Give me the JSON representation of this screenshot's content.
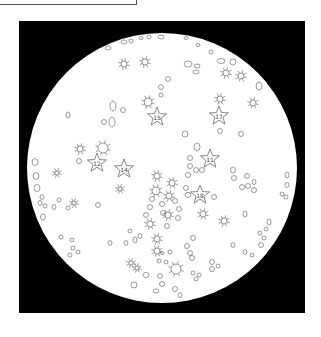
{
  "frame": {
    "label": ""
  },
  "plate": {
    "background": "#000000",
    "circle_fill": "#ffffff",
    "stroke": "#555555",
    "square": {
      "x": 19,
      "y": 21,
      "w": 286,
      "h": 292
    },
    "circle": {
      "cx": 162,
      "cy": 168,
      "r": 135
    }
  },
  "stars": [
    {
      "x": 157,
      "y": 117,
      "r": 10,
      "label": "15"
    },
    {
      "x": 219,
      "y": 116,
      "r": 10,
      "label": "17"
    },
    {
      "x": 97,
      "y": 163,
      "r": 10,
      "label": "12"
    },
    {
      "x": 124,
      "y": 169,
      "r": 10,
      "label": "14"
    },
    {
      "x": 210,
      "y": 159,
      "r": 10,
      "label": "11"
    },
    {
      "x": 200,
      "y": 195,
      "r": 10,
      "label": "18"
    }
  ],
  "suns": [
    {
      "x": 124,
      "y": 64,
      "r": 3
    },
    {
      "x": 145,
      "y": 62,
      "r": 3
    },
    {
      "x": 226,
      "y": 73,
      "r": 3
    },
    {
      "x": 241,
      "y": 76,
      "r": 3
    },
    {
      "x": 253,
      "y": 103,
      "r": 3
    },
    {
      "x": 148,
      "y": 102,
      "r": 4
    },
    {
      "x": 220,
      "y": 99,
      "r": 3
    },
    {
      "x": 80,
      "y": 149,
      "r": 3
    },
    {
      "x": 103,
      "y": 148,
      "r": 5
    },
    {
      "x": 57,
      "y": 173,
      "r": 2
    },
    {
      "x": 120,
      "y": 189,
      "r": 2
    },
    {
      "x": 157,
      "y": 176,
      "r": 3
    },
    {
      "x": 156,
      "y": 191,
      "r": 4
    },
    {
      "x": 172,
      "y": 183,
      "r": 3
    },
    {
      "x": 169,
      "y": 196,
      "r": 3
    },
    {
      "x": 168,
      "y": 215,
      "r": 3
    },
    {
      "x": 203,
      "y": 214,
      "r": 3
    },
    {
      "x": 224,
      "y": 221,
      "r": 3
    },
    {
      "x": 74,
      "y": 203,
      "r": 2
    },
    {
      "x": 150,
      "y": 224,
      "r": 3
    },
    {
      "x": 157,
      "y": 239,
      "r": 3
    },
    {
      "x": 157,
      "y": 251,
      "r": 3
    },
    {
      "x": 131,
      "y": 263,
      "r": 2
    },
    {
      "x": 137,
      "y": 268,
      "r": 2
    },
    {
      "x": 176,
      "y": 269,
      "r": 5
    }
  ],
  "blobs": [
    {
      "x": 124,
      "y": 42,
      "rx": 3,
      "ry": 2
    },
    {
      "x": 131,
      "y": 41,
      "rx": 2,
      "ry": 2
    },
    {
      "x": 141,
      "y": 38,
      "rx": 2,
      "ry": 1.5
    },
    {
      "x": 149,
      "y": 37,
      "rx": 2,
      "ry": 2
    },
    {
      "x": 161,
      "y": 37,
      "rx": 3,
      "ry": 2
    },
    {
      "x": 186,
      "y": 38,
      "rx": 2,
      "ry": 1.5
    },
    {
      "x": 198,
      "y": 45,
      "rx": 2,
      "ry": 1.5
    },
    {
      "x": 108,
      "y": 48,
      "rx": 3,
      "ry": 2
    },
    {
      "x": 211,
      "y": 52,
      "rx": 2,
      "ry": 2
    },
    {
      "x": 221,
      "y": 61,
      "rx": 4,
      "ry": 2.5
    },
    {
      "x": 233,
      "y": 62,
      "rx": 3,
      "ry": 3
    },
    {
      "x": 188,
      "y": 64,
      "rx": 4,
      "ry": 3
    },
    {
      "x": 197,
      "y": 66,
      "rx": 3,
      "ry": 2
    },
    {
      "x": 196,
      "y": 72,
      "rx": 3,
      "ry": 2
    },
    {
      "x": 168,
      "y": 79,
      "rx": 2.5,
      "ry": 2.5
    },
    {
      "x": 259,
      "y": 86,
      "rx": 3,
      "ry": 4
    },
    {
      "x": 161,
      "y": 87,
      "rx": 2.5,
      "ry": 2.5
    },
    {
      "x": 161,
      "y": 95,
      "rx": 2,
      "ry": 2
    },
    {
      "x": 113,
      "y": 106,
      "rx": 3,
      "ry": 5
    },
    {
      "x": 123,
      "y": 110,
      "rx": 2.5,
      "ry": 2.5
    },
    {
      "x": 68,
      "y": 115,
      "rx": 2,
      "ry": 3
    },
    {
      "x": 112,
      "y": 122,
      "rx": 3,
      "ry": 5
    },
    {
      "x": 104,
      "y": 122,
      "rx": 2.5,
      "ry": 2.5
    },
    {
      "x": 220,
      "y": 131,
      "rx": 2.5,
      "ry": 2.5
    },
    {
      "x": 241,
      "y": 134,
      "rx": 2.5,
      "ry": 2.5
    },
    {
      "x": 185,
      "y": 134,
      "rx": 3,
      "ry": 3
    },
    {
      "x": 197,
      "y": 147,
      "rx": 3,
      "ry": 4
    },
    {
      "x": 190,
      "y": 158,
      "rx": 2.5,
      "ry": 2.5
    },
    {
      "x": 79,
      "y": 161,
      "rx": 2.5,
      "ry": 2.5
    },
    {
      "x": 190,
      "y": 166,
      "rx": 2.5,
      "ry": 2.5
    },
    {
      "x": 196,
      "y": 170,
      "rx": 2.5,
      "ry": 2.5
    },
    {
      "x": 202,
      "y": 170,
      "rx": 2.5,
      "ry": 2.5
    },
    {
      "x": 35,
      "y": 162,
      "rx": 3,
      "ry": 3.5
    },
    {
      "x": 36,
      "y": 176,
      "rx": 3,
      "ry": 3.5
    },
    {
      "x": 37,
      "y": 188,
      "rx": 3,
      "ry": 3.5
    },
    {
      "x": 233,
      "y": 170,
      "rx": 2.5,
      "ry": 3
    },
    {
      "x": 234,
      "y": 178,
      "rx": 2.5,
      "ry": 2.5
    },
    {
      "x": 247,
      "y": 176,
      "rx": 2.5,
      "ry": 2.5
    },
    {
      "x": 242,
      "y": 187,
      "rx": 2.5,
      "ry": 2.5
    },
    {
      "x": 248,
      "y": 186,
      "rx": 2.5,
      "ry": 2.5
    },
    {
      "x": 254,
      "y": 182,
      "rx": 2,
      "ry": 2.5
    },
    {
      "x": 254,
      "y": 190,
      "rx": 2.5,
      "ry": 2.5
    },
    {
      "x": 188,
      "y": 175,
      "rx": 2.5,
      "ry": 2.5
    },
    {
      "x": 186,
      "y": 188,
      "rx": 2.5,
      "ry": 2.5
    },
    {
      "x": 188,
      "y": 195,
      "rx": 3,
      "ry": 2.5
    },
    {
      "x": 214,
      "y": 197,
      "rx": 2.5,
      "ry": 2.5
    },
    {
      "x": 287,
      "y": 175,
      "rx": 2,
      "ry": 3
    },
    {
      "x": 287,
      "y": 185,
      "rx": 2,
      "ry": 2.5
    },
    {
      "x": 282,
      "y": 194,
      "rx": 2,
      "ry": 2
    },
    {
      "x": 286,
      "y": 197,
      "rx": 2,
      "ry": 2
    },
    {
      "x": 42,
      "y": 197,
      "rx": 2,
      "ry": 2.5
    },
    {
      "x": 40,
      "y": 203,
      "rx": 2,
      "ry": 2.5
    },
    {
      "x": 45,
      "y": 206,
      "rx": 2,
      "ry": 2
    },
    {
      "x": 54,
      "y": 207,
      "rx": 2,
      "ry": 2.5
    },
    {
      "x": 59,
      "y": 200,
      "rx": 2,
      "ry": 2
    },
    {
      "x": 68,
      "y": 208,
      "rx": 2,
      "ry": 2
    },
    {
      "x": 43,
      "y": 217,
      "rx": 2.5,
      "ry": 3
    },
    {
      "x": 98,
      "y": 205,
      "rx": 2.5,
      "ry": 2.5
    },
    {
      "x": 152,
      "y": 199,
      "rx": 2.5,
      "ry": 2.5
    },
    {
      "x": 150,
      "y": 207,
      "rx": 2.5,
      "ry": 2.5
    },
    {
      "x": 162,
      "y": 204,
      "rx": 2.5,
      "ry": 2.5
    },
    {
      "x": 163,
      "y": 213,
      "rx": 2.5,
      "ry": 2.5
    },
    {
      "x": 175,
      "y": 201,
      "rx": 2.5,
      "ry": 2.5
    },
    {
      "x": 179,
      "y": 209,
      "rx": 2.5,
      "ry": 2.5
    },
    {
      "x": 178,
      "y": 218,
      "rx": 2.5,
      "ry": 2.5
    },
    {
      "x": 167,
      "y": 226,
      "rx": 2.5,
      "ry": 2.5
    },
    {
      "x": 146,
      "y": 215,
      "rx": 2.5,
      "ry": 2.5
    },
    {
      "x": 245,
      "y": 214,
      "rx": 2,
      "ry": 3
    },
    {
      "x": 269,
      "y": 222,
      "rx": 2,
      "ry": 3
    },
    {
      "x": 266,
      "y": 229,
      "rx": 2,
      "ry": 2
    },
    {
      "x": 260,
      "y": 233,
      "rx": 2,
      "ry": 2
    },
    {
      "x": 264,
      "y": 238,
      "rx": 2,
      "ry": 2
    },
    {
      "x": 261,
      "y": 245,
      "rx": 2.5,
      "ry": 2.5
    },
    {
      "x": 130,
      "y": 231,
      "rx": 2,
      "ry": 2
    },
    {
      "x": 135,
      "y": 240,
      "rx": 2,
      "ry": 3
    },
    {
      "x": 140,
      "y": 236,
      "rx": 2,
      "ry": 2.5
    },
    {
      "x": 126,
      "y": 243,
      "rx": 2,
      "ry": 2.5
    },
    {
      "x": 110,
      "y": 243,
      "rx": 2,
      "ry": 2.5
    },
    {
      "x": 193,
      "y": 238,
      "rx": 2.5,
      "ry": 2.5
    },
    {
      "x": 187,
      "y": 246,
      "rx": 2.5,
      "ry": 2.5
    },
    {
      "x": 190,
      "y": 253,
      "rx": 2.5,
      "ry": 2.5
    },
    {
      "x": 192,
      "y": 258,
      "rx": 2.5,
      "ry": 2.5
    },
    {
      "x": 233,
      "y": 245,
      "rx": 2,
      "ry": 2.5
    },
    {
      "x": 245,
      "y": 252,
      "rx": 2,
      "ry": 2.5
    },
    {
      "x": 252,
      "y": 255,
      "rx": 2,
      "ry": 2
    },
    {
      "x": 61,
      "y": 237,
      "rx": 2,
      "ry": 2
    },
    {
      "x": 72,
      "y": 240,
      "rx": 2,
      "ry": 2
    },
    {
      "x": 73,
      "y": 248,
      "rx": 2,
      "ry": 2
    },
    {
      "x": 70,
      "y": 255,
      "rx": 2,
      "ry": 2
    },
    {
      "x": 78,
      "y": 252,
      "rx": 2,
      "ry": 2
    },
    {
      "x": 162,
      "y": 253,
      "rx": 2,
      "ry": 1.5
    },
    {
      "x": 170,
      "y": 252,
      "rx": 2,
      "ry": 2
    },
    {
      "x": 159,
      "y": 261,
      "rx": 2,
      "ry": 2
    },
    {
      "x": 166,
      "y": 262,
      "rx": 2,
      "ry": 2
    },
    {
      "x": 212,
      "y": 262,
      "rx": 2.5,
      "ry": 2.5
    },
    {
      "x": 212,
      "y": 269,
      "rx": 2.5,
      "ry": 2.5
    },
    {
      "x": 218,
      "y": 266,
      "rx": 2,
      "ry": 2
    },
    {
      "x": 193,
      "y": 273,
      "rx": 2,
      "ry": 2
    },
    {
      "x": 196,
      "y": 279,
      "rx": 2,
      "ry": 2
    },
    {
      "x": 199,
      "y": 275,
      "rx": 2,
      "ry": 2
    },
    {
      "x": 146,
      "y": 275,
      "rx": 3,
      "ry": 2.5
    },
    {
      "x": 160,
      "y": 276,
      "rx": 2.5,
      "ry": 2.5
    },
    {
      "x": 162,
      "y": 284,
      "rx": 2.5,
      "ry": 2.5
    },
    {
      "x": 134,
      "y": 285,
      "rx": 3,
      "ry": 3
    },
    {
      "x": 156,
      "y": 291,
      "rx": 3,
      "ry": 2
    },
    {
      "x": 175,
      "y": 289,
      "rx": 2.5,
      "ry": 2.5
    },
    {
      "x": 180,
      "y": 295,
      "rx": 2,
      "ry": 2.5
    }
  ]
}
